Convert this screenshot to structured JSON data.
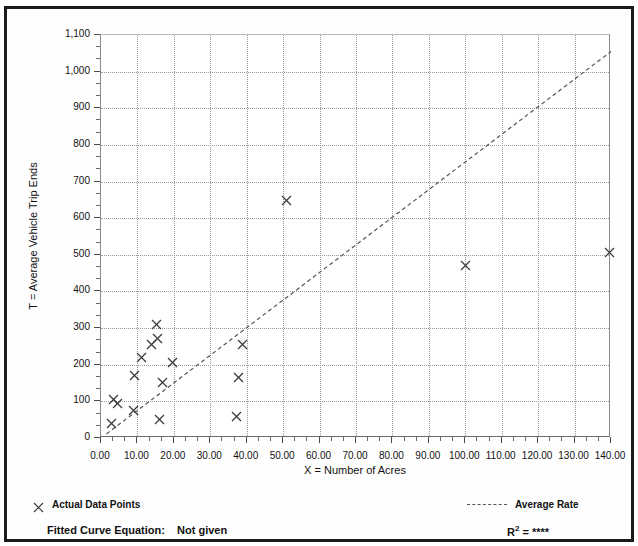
{
  "document": {
    "title_sliver": "(partially cropped heading)"
  },
  "chart_data": {
    "type": "scatter",
    "title": "",
    "xlabel": "X = Number of Acres",
    "ylabel": "T = Average Vehicle Trip Ends",
    "xlim": [
      0,
      140
    ],
    "ylim": [
      0,
      1100
    ],
    "xticks": [
      0,
      10,
      20,
      30,
      40,
      50,
      60,
      70,
      80,
      90,
      100,
      110,
      120,
      130,
      140
    ],
    "xticklabels": [
      "0.00",
      "10.00",
      "20.00",
      "30.00",
      "40.00",
      "50.00",
      "60.00",
      "70.00",
      "80.00",
      "90.00",
      "100.00",
      "110.00",
      "120.00",
      "130.00",
      "140.00"
    ],
    "yticks": [
      0,
      100,
      200,
      300,
      400,
      500,
      600,
      700,
      800,
      900,
      1000,
      1100
    ],
    "yticklabels": [
      "0",
      "100",
      "200",
      "300",
      "400",
      "500",
      "600",
      "700",
      "800",
      "900",
      "1,000",
      "1,100"
    ],
    "grid": true,
    "grid_style": "dotted",
    "x_minor_ticks_per_interval": 2,
    "y_minor_ticks_per_interval": 2,
    "legend_position": "below-plot",
    "series": [
      {
        "name": "Actual Data Points",
        "type": "scatter",
        "marker": "x",
        "color": "#3a3a3a",
        "points": [
          [
            2.9,
            40
          ],
          [
            3.4,
            106
          ],
          [
            4.6,
            95
          ],
          [
            8.8,
            75
          ],
          [
            9.2,
            170
          ],
          [
            11.2,
            221
          ],
          [
            13.8,
            256
          ],
          [
            15.2,
            311
          ],
          [
            15.5,
            272
          ],
          [
            16.0,
            50
          ],
          [
            17.0,
            151
          ],
          [
            19.5,
            205
          ],
          [
            37.2,
            60
          ],
          [
            37.8,
            166
          ],
          [
            38.8,
            255
          ],
          [
            50.8,
            648
          ],
          [
            100.0,
            472
          ],
          [
            139.6,
            507
          ]
        ]
      },
      {
        "name": "Average Rate",
        "type": "line",
        "style": "dashed",
        "color": "#555555",
        "points": [
          [
            1.5,
            11
          ],
          [
            140.0,
            1055
          ]
        ]
      }
    ]
  },
  "legend": {
    "actual_data_points_label": "Actual Data Points",
    "actual_data_points_marker": "x-marker-icon",
    "average_rate_label": "Average Rate",
    "average_rate_marker": "dashed-line-icon"
  },
  "footer": {
    "fitted_curve_label": "Fitted Curve Equation:",
    "fitted_curve_value": "Not given",
    "r_squared_prefix": "R",
    "r_squared_exponent": "2",
    "r_squared_value": "= ****"
  },
  "colors": {
    "frame": "#1b1b1b",
    "axis": "#6b6b6b",
    "grid": "#9a9a9a",
    "marker": "#3a3a3a",
    "trendline": "#555555",
    "text": "#111111",
    "background": "#ffffff"
  }
}
